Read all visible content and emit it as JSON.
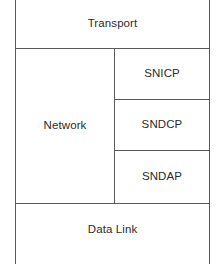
{
  "diagram": {
    "type": "layered-block-diagram",
    "line_color": "#5a5a5a",
    "text_color": "#2b2b2b",
    "background_color": "#ffffff",
    "layers": [
      {
        "id": "transport",
        "label": "Transport",
        "span": "full-width",
        "row": 1
      },
      {
        "id": "network",
        "label": "Network",
        "span": "left-column",
        "row": 2,
        "sublayers": [
          {
            "id": "snicp",
            "label": "SNICP",
            "row": 1
          },
          {
            "id": "sndcp",
            "label": "SNDCP",
            "row": 2
          },
          {
            "id": "sndap",
            "label": "SNDAP",
            "row": 3
          }
        ]
      },
      {
        "id": "datalink",
        "label": "Data Link",
        "span": "full-width",
        "row": 3
      }
    ]
  }
}
